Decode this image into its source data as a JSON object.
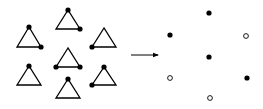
{
  "diagram": {
    "width": 263,
    "height": 109,
    "colors": {
      "stroke": "#000000",
      "filled": "#000000",
      "open_fill": "#ffffff",
      "background": "#ffffff"
    },
    "triangles": [
      {
        "id": "t1",
        "apex": [
          29,
          27
        ],
        "left": [
          17,
          47
        ],
        "right": [
          41,
          47
        ],
        "dots": [
          "apex",
          "right"
        ]
      },
      {
        "id": "t2",
        "apex": [
          68,
          10
        ],
        "left": [
          56,
          29
        ],
        "right": [
          80,
          29
        ],
        "dots": [
          "apex",
          "right"
        ]
      },
      {
        "id": "t3",
        "apex": [
          104,
          28
        ],
        "left": [
          92,
          47
        ],
        "right": [
          116,
          47
        ],
        "dots": [
          "left"
        ]
      },
      {
        "id": "t4",
        "apex": [
          68,
          48
        ],
        "left": [
          56,
          67
        ],
        "right": [
          80,
          67
        ],
        "dots": [
          "left",
          "right"
        ]
      },
      {
        "id": "t5",
        "apex": [
          29,
          66
        ],
        "left": [
          17,
          85
        ],
        "right": [
          41,
          85
        ],
        "dots": [
          "apex"
        ]
      },
      {
        "id": "t6",
        "apex": [
          68,
          79
        ],
        "left": [
          56,
          98
        ],
        "right": [
          80,
          98
        ],
        "dots": [
          "apex"
        ]
      },
      {
        "id": "t7",
        "apex": [
          104,
          67
        ],
        "left": [
          92,
          85
        ],
        "right": [
          116,
          85
        ],
        "dots": [
          "apex",
          "left"
        ]
      }
    ],
    "arrow": {
      "from": [
        131,
        55
      ],
      "to": [
        158,
        55
      ]
    },
    "nodes": [
      {
        "id": "n2",
        "x": 209,
        "y": 13,
        "type": "filled"
      },
      {
        "id": "n1",
        "x": 170,
        "y": 35,
        "type": "filled"
      },
      {
        "id": "n3",
        "x": 246,
        "y": 36,
        "type": "open"
      },
      {
        "id": "n4",
        "x": 209,
        "y": 57,
        "type": "filled"
      },
      {
        "id": "n5",
        "x": 170,
        "y": 78,
        "type": "open"
      },
      {
        "id": "n7",
        "x": 247,
        "y": 78,
        "type": "filled"
      },
      {
        "id": "n6",
        "x": 210,
        "y": 98,
        "type": "open"
      }
    ]
  }
}
